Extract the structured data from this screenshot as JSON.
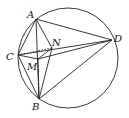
{
  "diagram": {
    "type": "geometry",
    "circle": {
      "cx": 68,
      "cy": 58,
      "r": 50
    },
    "points": {
      "A": {
        "x": 36,
        "y": 19,
        "label": "A",
        "lx": 27,
        "ly": 18
      },
      "B": {
        "x": 39,
        "y": 99,
        "label": "B",
        "lx": 32,
        "ly": 110
      },
      "C": {
        "x": 18,
        "y": 55,
        "label": "C",
        "lx": 6,
        "ly": 60
      },
      "D": {
        "x": 112,
        "y": 40,
        "label": "D",
        "lx": 114,
        "ly": 42
      },
      "M": {
        "x": 38,
        "y": 59,
        "label": "M",
        "lx": 27,
        "ly": 70
      },
      "N": {
        "x": 52,
        "y": 48,
        "label": "N",
        "lx": 52,
        "ly": 46
      }
    },
    "segments": [
      [
        "A",
        "B"
      ],
      [
        "A",
        "C"
      ],
      [
        "A",
        "D"
      ],
      [
        "A",
        "N"
      ],
      [
        "B",
        "C"
      ],
      [
        "B",
        "D"
      ],
      [
        "B",
        "N"
      ],
      [
        "B",
        "M"
      ],
      [
        "C",
        "D"
      ],
      [
        "C",
        "M"
      ],
      [
        "M",
        "D"
      ],
      [
        "M",
        "N"
      ]
    ],
    "dashed_segments": [
      [
        "C",
        "N"
      ]
    ]
  }
}
